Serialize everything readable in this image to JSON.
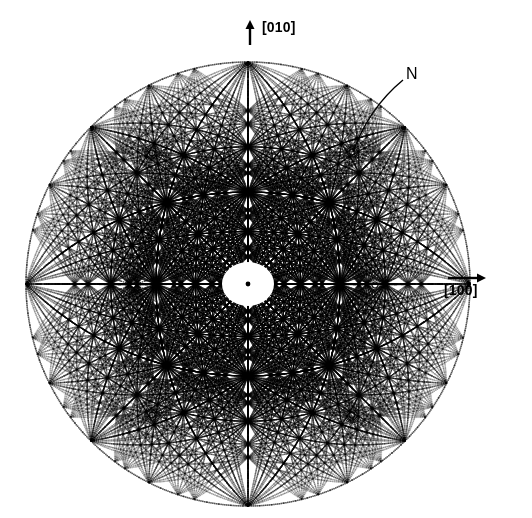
{
  "figure": {
    "kind": "stereographic-projection",
    "background_color": "#ffffff",
    "ink_color": "#000000",
    "center": {
      "x": 248,
      "y": 284
    },
    "radius_x": 222,
    "radius_y": 222
  },
  "annotations": {
    "axis_vertical": {
      "label": "[010]",
      "icon": "arrow-up-icon",
      "arrow": {
        "x": 250,
        "y_from": 45,
        "y_to": 20
      },
      "text_pos": {
        "x": 262,
        "y": 20
      }
    },
    "axis_horizontal": {
      "label": "[100]",
      "icon": "arrow-right-icon",
      "arrow": {
        "x_from": 448,
        "x_to": 486,
        "y": 278
      },
      "text_pos": {
        "x": 444,
        "y": 283
      }
    },
    "pole_marker": {
      "label": "N",
      "icon": "leader-line-icon",
      "target": {
        "x": 352,
        "y": 152
      },
      "text_pos": {
        "x": 406,
        "y": 66
      },
      "leader": {
        "x1": 403,
        "y1": 80,
        "x2": 353,
        "y2": 152
      }
    }
  },
  "chart_data": {
    "type": "scatter",
    "title": "",
    "xlabel": "[100]",
    "ylabel": "[010]",
    "projection": "stereographic",
    "grid": false,
    "legend": null,
    "center": [
      248,
      284
    ],
    "outer_radius": 222,
    "marker_style": "dotted-arc",
    "zone_axis_nodes": [
      {
        "name": "origin",
        "x": 248,
        "y": 284,
        "order": 12,
        "emphasis": "solid-dot"
      },
      {
        "name": "node-upper-left",
        "x": 152,
        "y": 153,
        "order": 12,
        "emphasis": "radiating"
      },
      {
        "name": "N",
        "x": 352,
        "y": 152,
        "order": 12,
        "emphasis": "radiating"
      },
      {
        "name": "node-lower-left",
        "x": 152,
        "y": 415,
        "order": 12,
        "emphasis": "radiating"
      },
      {
        "name": "node-lower-right",
        "x": 352,
        "y": 415,
        "order": 12,
        "emphasis": "radiating"
      },
      {
        "name": "node-left-axis",
        "x": 133,
        "y": 285,
        "order": 10,
        "emphasis": "radiating"
      },
      {
        "name": "node-right-axis",
        "x": 375,
        "y": 285,
        "order": 10,
        "emphasis": "radiating"
      },
      {
        "name": "node-top",
        "x": 249,
        "y": 65,
        "order": 8,
        "emphasis": "arc-crossing"
      },
      {
        "name": "node-bottom",
        "x": 249,
        "y": 497,
        "order": 8,
        "emphasis": "arc-crossing"
      }
    ],
    "great_circles_through_center": 36,
    "latitude_circles": 26,
    "ring_radii": [
      14,
      22,
      30,
      40,
      52,
      66,
      82,
      100,
      120,
      142,
      166,
      192,
      220
    ],
    "xlim": [
      26,
      480
    ],
    "ylim": [
      52,
      500
    ]
  }
}
